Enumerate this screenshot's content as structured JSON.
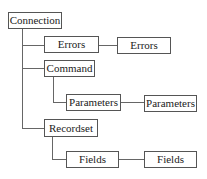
{
  "diagram": {
    "type": "object-model-tree",
    "line_color": "#666666",
    "border_color": "#555555",
    "nodes": {
      "connection": {
        "label": "Connection"
      },
      "errors": {
        "label": "Errors"
      },
      "errors_item": {
        "label": "Errors"
      },
      "command": {
        "label": "Command"
      },
      "parameters": {
        "label": "Parameters"
      },
      "parameters_item": {
        "label": "Parameters"
      },
      "recordset": {
        "label": "Recordset"
      },
      "fields": {
        "label": "Fields"
      },
      "fields_item": {
        "label": "Fields"
      }
    },
    "edges": [
      {
        "from": "connection",
        "to": "errors"
      },
      {
        "from": "errors",
        "to": "errors_item"
      },
      {
        "from": "connection",
        "to": "command"
      },
      {
        "from": "command",
        "to": "parameters"
      },
      {
        "from": "parameters",
        "to": "parameters_item"
      },
      {
        "from": "connection",
        "to": "recordset"
      },
      {
        "from": "recordset",
        "to": "fields"
      },
      {
        "from": "fields",
        "to": "fields_item"
      }
    ]
  }
}
